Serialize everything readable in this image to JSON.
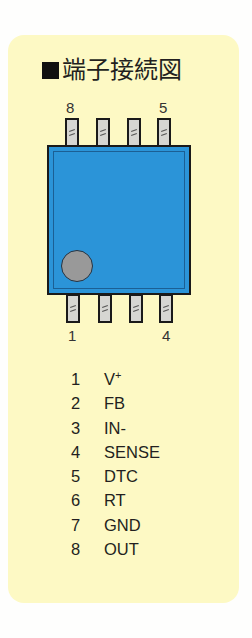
{
  "title": "端子接続図",
  "title_marker": "■",
  "chip": {
    "body_color": "#2b94d8",
    "top_labels": {
      "left": "8",
      "right": "5"
    },
    "bottom_labels": {
      "left": "1",
      "right": "4"
    },
    "top_pins": [
      "8",
      "7",
      "6",
      "5"
    ],
    "bottom_pins": [
      "1",
      "2",
      "3",
      "4"
    ]
  },
  "pins": [
    {
      "num": "1",
      "name": "V",
      "sup": "+"
    },
    {
      "num": "2",
      "name": "FB",
      "sup": ""
    },
    {
      "num": "3",
      "name": "IN-",
      "sup": ""
    },
    {
      "num": "4",
      "name": "SENSE",
      "sup": ""
    },
    {
      "num": "5",
      "name": "DTC",
      "sup": ""
    },
    {
      "num": "6",
      "name": "RT",
      "sup": ""
    },
    {
      "num": "7",
      "name": "GND",
      "sup": ""
    },
    {
      "num": "8",
      "name": "OUT",
      "sup": ""
    }
  ],
  "colors": {
    "panel": "#fdf9c4",
    "background": "#fefefd",
    "chip": "#2b94d8",
    "pin": "#d6d6d2",
    "dot": "#999999"
  }
}
